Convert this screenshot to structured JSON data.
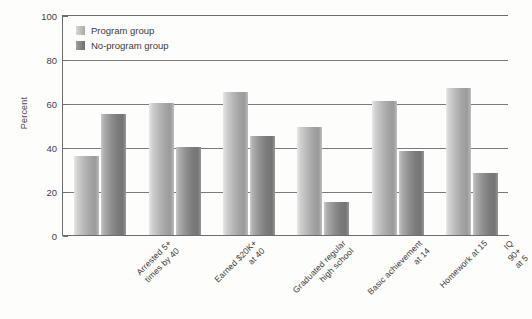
{
  "chart_data": {
    "type": "bar",
    "title": "",
    "xlabel": "",
    "ylabel": "Percent",
    "ylim": [
      0,
      100
    ],
    "yticks": [
      0,
      20,
      40,
      60,
      80,
      100
    ],
    "grid": true,
    "legend_position": "top-left",
    "categories": [
      "Arrested 5+\ntimes by 40",
      "Earned $20K+\nat 40",
      "Graduated regular\nhigh school",
      "Basic achievement\nat 14",
      "Homework at 15",
      "IQ 90+ at 5"
    ],
    "series": [
      {
        "name": "Program group",
        "color": "#b4b4b4",
        "values": [
          36,
          60,
          65,
          49,
          61,
          67
        ]
      },
      {
        "name": "No-program group",
        "color": "#848484",
        "values": [
          55,
          40,
          45,
          15,
          38,
          28
        ]
      }
    ]
  },
  "axis": {
    "y_title": "Percent",
    "y_tick_labels": [
      "0",
      "20",
      "40",
      "60",
      "80",
      "100"
    ]
  },
  "legend": {
    "items": [
      {
        "label": "Program group"
      },
      {
        "label": "No-program group"
      }
    ]
  },
  "colors": {
    "axis": "#6d6d6d",
    "grid": "#7a7a7a",
    "text": "#3a3a3a",
    "background": "#fdfdfb"
  }
}
